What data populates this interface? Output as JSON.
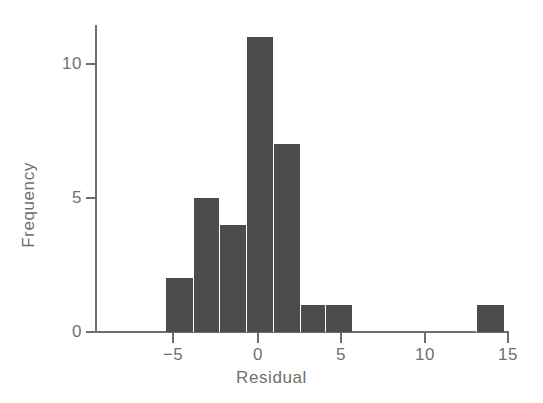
{
  "chart_data": {
    "type": "bar",
    "title": "",
    "subtitle": "",
    "xlabel": "Residual",
    "ylabel": "Frequency",
    "grid": false,
    "legend": false,
    "legend_position": "none",
    "xlim": [
      -8,
      15
    ],
    "ylim": [
      0,
      11.6
    ],
    "xticks": [
      -5,
      0,
      5,
      10,
      15
    ],
    "xtick_labels": [
      "−5",
      "0",
      "5",
      "10",
      "15"
    ],
    "yticks": [
      0,
      5,
      10
    ],
    "ytick_labels": [
      "0",
      "5",
      "10"
    ],
    "bin_width": 1.6,
    "bins": [
      {
        "label": "-5.5 to -3.9",
        "x_left": -5.5,
        "x_right": -3.9,
        "value": 2
      },
      {
        "label": "-3.9 to -2.3",
        "x_left": -3.9,
        "x_right": -2.3,
        "value": 5
      },
      {
        "label": "-2.3 to -0.7",
        "x_left": -2.3,
        "x_right": -0.7,
        "value": 4
      },
      {
        "label": "-0.7 to 0.9",
        "x_left": -0.7,
        "x_right": 0.9,
        "value": 11
      },
      {
        "label": "0.9 to 2.5",
        "x_left": 0.9,
        "x_right": 2.5,
        "value": 7
      },
      {
        "label": "2.5 to 4.0",
        "x_left": 2.5,
        "x_right": 4.0,
        "value": 1
      },
      {
        "label": "4.0 to 5.6",
        "x_left": 4.0,
        "x_right": 5.6,
        "value": 1
      },
      {
        "label": "13.0 to 14.7",
        "x_left": 13.0,
        "x_right": 14.7,
        "value": 1
      }
    ],
    "categories": [
      "-5.5 to -3.9",
      "-3.9 to -2.3",
      "-2.3 to -0.7",
      "-0.7 to 0.9",
      "0.9 to 2.5",
      "2.5 to 4.0",
      "4.0 to 5.6",
      "13.0 to 14.7"
    ],
    "values": [
      2,
      5,
      4,
      11,
      7,
      1,
      1,
      1
    ],
    "colors": {
      "bar": "#4c4c4c",
      "axis": "#6e6e6e",
      "text": "#6f6f6f",
      "background": "#ffffff"
    }
  }
}
